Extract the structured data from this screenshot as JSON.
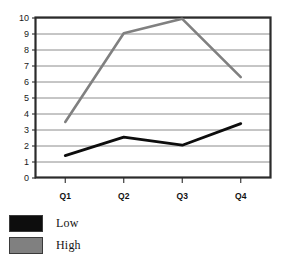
{
  "chart_data": {
    "type": "line",
    "title": "",
    "subtitle": "",
    "xlabel": "",
    "ylabel": "",
    "categories": [
      "Q1",
      "Q2",
      "Q3",
      "Q4"
    ],
    "series": [
      {
        "name": "Low",
        "color": "#0d0d0d",
        "values": [
          1.4,
          2.55,
          2.05,
          3.4
        ]
      },
      {
        "name": "High",
        "color": "#808080",
        "values": [
          3.5,
          9.05,
          9.95,
          6.3
        ]
      }
    ],
    "ylim": [
      0,
      10
    ],
    "y_ticks": [
      0,
      1,
      2,
      3,
      4,
      5,
      6,
      7,
      8,
      9,
      10
    ],
    "y_tick_labels": [
      "0",
      "1",
      "2",
      "3",
      "4",
      "5",
      "6",
      "7",
      "8",
      "9",
      "10"
    ],
    "grid": true,
    "grid_axis": "y",
    "grid_color": "#8c8c8c",
    "legend": true,
    "legend_position": "bottom-left",
    "legend_entries": [
      {
        "label": "Low",
        "color": "#0d0d0d"
      },
      {
        "label": "High",
        "color": "#808080"
      }
    ],
    "frame_color": "#2b2b2b",
    "background": "#ffffff"
  },
  "axes": {
    "y_labels": [
      "10",
      "9",
      "8",
      "7",
      "6",
      "5",
      "4",
      "3",
      "2",
      "1",
      "0"
    ],
    "x_labels": [
      "Q1",
      "Q2",
      "Q3",
      "Q4"
    ]
  },
  "legend": {
    "items": [
      {
        "label": "Low"
      },
      {
        "label": "High"
      }
    ]
  }
}
